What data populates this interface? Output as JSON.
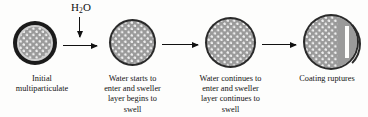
{
  "figure": {
    "reagent_label": "H",
    "reagent_sub": "2",
    "reagent_label_tail": "O",
    "background_color": "#fdfdfc",
    "coating_color": "#1b1b1b",
    "core_color": "#9a9a9a",
    "stipple_color": "#efefef",
    "arrow_color": "#111111"
  },
  "stages": [
    {
      "id": "stage-1",
      "caption_lines": [
        "Initial",
        "multiparticulate"
      ],
      "caption": "Initial multiparticulate",
      "diameter_px": 44,
      "has_thick_coating": true,
      "has_light_ring": true,
      "ruptured": false
    },
    {
      "id": "stage-2",
      "caption_lines": [
        "Water starts to",
        "enter and sweller",
        "layer begins to",
        "swell"
      ],
      "caption": "Water starts to enter and sweller layer begins to swell",
      "diameter_px": 47,
      "has_thick_coating": false,
      "has_light_ring": false,
      "ruptured": false
    },
    {
      "id": "stage-3",
      "caption_lines": [
        "Water continues to",
        "enter and sweller",
        "layer continues to",
        "swell"
      ],
      "caption": "Water continues to enter and sweller layer continues to swell",
      "diameter_px": 51,
      "has_thick_coating": false,
      "has_light_ring": false,
      "ruptured": false
    },
    {
      "id": "stage-4",
      "caption_lines": [
        "Coating ruptures"
      ],
      "caption": "Coating ruptures",
      "diameter_px": 56,
      "has_thick_coating": false,
      "has_light_ring": false,
      "ruptured": true
    }
  ],
  "arrows": [
    {
      "id": "arrow-water-in",
      "orientation": "vertical",
      "direction": "down",
      "label": "H2O"
    },
    {
      "id": "arrow-1-to-2",
      "orientation": "horizontal",
      "direction": "right",
      "label": ""
    },
    {
      "id": "arrow-2-to-3",
      "orientation": "horizontal",
      "direction": "right",
      "label": ""
    },
    {
      "id": "arrow-3-to-4",
      "orientation": "horizontal",
      "direction": "right",
      "label": ""
    }
  ]
}
